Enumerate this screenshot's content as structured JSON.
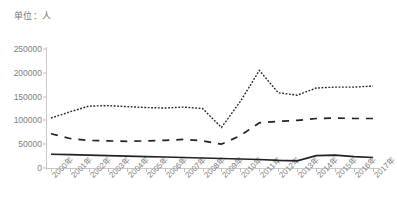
{
  "unit_label": "单位：人",
  "chart_data": {
    "type": "line",
    "title": "",
    "xlabel": "",
    "ylabel": "",
    "unit": "单位：人",
    "grid": false,
    "legend": "none",
    "ylim": [
      0,
      250000
    ],
    "ytick_labels": [
      "0",
      "50000",
      "100000",
      "150000",
      "200000",
      "250000"
    ],
    "ytick_values": [
      0,
      50000,
      100000,
      150000,
      200000,
      250000
    ],
    "categories": [
      "2000年",
      "2001年",
      "2002年",
      "2003年",
      "2004年",
      "2005年",
      "2006年",
      "2007年",
      "2008年",
      "2009年",
      "2010年",
      "2011年",
      "2012年",
      "2013年",
      "2014年",
      "2015年",
      "2016年",
      "2017年"
    ],
    "series": [
      {
        "name": "series-dashdot-top",
        "style": "dash-dot",
        "values": [
          105000,
          118000,
          130000,
          131000,
          129000,
          127000,
          126000,
          128000,
          125000,
          85000,
          140000,
          205000,
          158000,
          153000,
          168000,
          170000,
          170000,
          172000
        ]
      },
      {
        "name": "series-dashed-middle",
        "style": "dashed",
        "values": [
          72000,
          62000,
          58000,
          57000,
          56000,
          57000,
          58000,
          60000,
          57000,
          50000,
          68000,
          95000,
          98000,
          100000,
          104000,
          105000,
          104000,
          104000
        ]
      },
      {
        "name": "series-solid-bottom",
        "style": "solid",
        "values": [
          29000,
          28000,
          27000,
          26000,
          25000,
          24000,
          23000,
          22000,
          21000,
          20000,
          19000,
          18000,
          16000,
          15000,
          26000,
          27000,
          24000,
          22000
        ]
      }
    ]
  }
}
